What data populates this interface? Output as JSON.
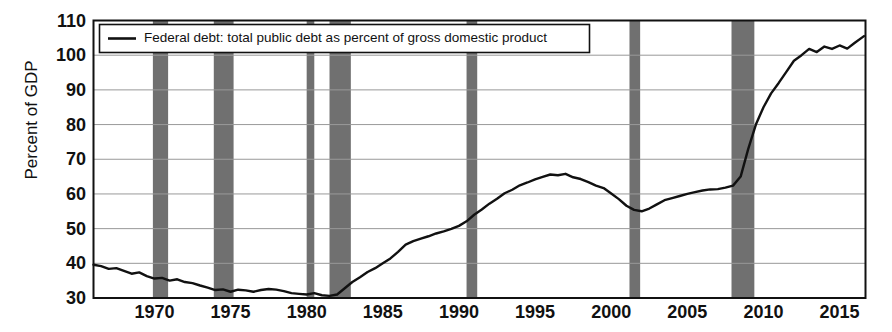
{
  "chart_data": {
    "type": "line",
    "title": "",
    "xlabel": "",
    "ylabel": "Percent of GDP",
    "xlim": [
      1966.0,
      2016.7
    ],
    "ylim": [
      30,
      110
    ],
    "ytick_values": [
      30,
      40,
      50,
      60,
      70,
      80,
      90,
      100,
      110
    ],
    "ytick_labels": [
      "30",
      "40",
      "50",
      "60",
      "70",
      "80",
      "90",
      "100",
      "110"
    ],
    "xtick_values": [
      1970,
      1975,
      1980,
      1985,
      1990,
      1995,
      2000,
      2005,
      2010,
      2015
    ],
    "xtick_labels": [
      "1970",
      "1975",
      "1980",
      "1985",
      "1990",
      "1995",
      "2000",
      "2005",
      "2010",
      "2015"
    ],
    "grid": true,
    "legend_position": "upper-left",
    "legend_entries": [
      {
        "label": "Federal debt: total public debt as percent of gross domestic product",
        "color": "#111111",
        "marker": "line"
      }
    ],
    "line_color": "#111111",
    "recession_band_color": "#707070",
    "recession_bands": [
      {
        "start": 1969.9,
        "end": 1970.9
      },
      {
        "start": 1973.9,
        "end": 1975.2
      },
      {
        "start": 1980.0,
        "end": 1980.5
      },
      {
        "start": 1981.5,
        "end": 1982.9
      },
      {
        "start": 1990.5,
        "end": 1991.2
      },
      {
        "start": 2001.2,
        "end": 2001.9
      },
      {
        "start": 2007.9,
        "end": 2009.4
      }
    ],
    "series": [
      {
        "name": "Federal debt: total public debt as percent of gross domestic product",
        "x": [
          1966.0,
          1966.5,
          1967.0,
          1967.5,
          1968.0,
          1968.5,
          1969.0,
          1969.5,
          1970.0,
          1970.5,
          1971.0,
          1971.5,
          1972.0,
          1972.5,
          1973.0,
          1973.5,
          1974.0,
          1974.5,
          1975.0,
          1975.5,
          1976.0,
          1976.5,
          1977.0,
          1977.5,
          1978.0,
          1978.5,
          1979.0,
          1979.5,
          1980.0,
          1980.5,
          1981.0,
          1981.5,
          1982.0,
          1982.5,
          1983.0,
          1983.5,
          1984.0,
          1984.5,
          1985.0,
          1985.5,
          1986.0,
          1986.5,
          1987.0,
          1987.5,
          1988.0,
          1988.5,
          1989.0,
          1989.5,
          1990.0,
          1990.5,
          1991.0,
          1991.5,
          1992.0,
          1992.5,
          1993.0,
          1993.5,
          1994.0,
          1994.5,
          1995.0,
          1995.5,
          1996.0,
          1996.5,
          1997.0,
          1997.5,
          1998.0,
          1998.5,
          1999.0,
          1999.5,
          2000.0,
          2000.5,
          2001.0,
          2001.5,
          2002.0,
          2002.5,
          2003.0,
          2003.5,
          2004.0,
          2004.5,
          2005.0,
          2005.5,
          2006.0,
          2006.5,
          2007.0,
          2007.5,
          2008.0,
          2008.5,
          2009.0,
          2009.5,
          2010.0,
          2010.5,
          2011.0,
          2011.5,
          2012.0,
          2012.5,
          2013.0,
          2013.5,
          2014.0,
          2014.5,
          2015.0,
          2015.5,
          2016.0,
          2016.6
        ],
        "y": [
          39.6,
          39.2,
          38.4,
          38.6,
          37.8,
          37.0,
          37.4,
          36.3,
          35.6,
          35.8,
          35.0,
          35.4,
          34.6,
          34.3,
          33.6,
          33.0,
          32.3,
          32.5,
          31.8,
          32.4,
          32.2,
          31.8,
          32.3,
          32.6,
          32.4,
          32.0,
          31.4,
          31.2,
          31.0,
          31.4,
          30.8,
          30.6,
          31.0,
          32.8,
          34.6,
          36.0,
          37.5,
          38.6,
          40.0,
          41.4,
          43.3,
          45.4,
          46.4,
          47.1,
          47.8,
          48.6,
          49.2,
          49.9,
          50.8,
          52.1,
          54.0,
          55.5,
          57.2,
          58.6,
          60.2,
          61.2,
          62.5,
          63.3,
          64.2,
          64.9,
          65.6,
          65.4,
          65.8,
          64.8,
          64.3,
          63.4,
          62.4,
          61.7,
          60.1,
          58.5,
          56.6,
          55.4,
          55.0,
          55.8,
          57.0,
          58.2,
          58.8,
          59.4,
          60.0,
          60.5,
          61.0,
          61.3,
          61.4,
          61.8,
          62.4,
          65.0,
          73.0,
          80.0,
          85.0,
          89.0,
          92.0,
          95.2,
          98.4,
          100.0,
          101.8,
          100.9,
          102.5,
          101.8,
          102.8,
          101.9,
          103.6,
          105.5
        ]
      }
    ]
  },
  "legend": {
    "label": "Federal debt: total public debt as percent of gross domestic product"
  },
  "axes": {
    "y_title": "Percent of GDP"
  }
}
